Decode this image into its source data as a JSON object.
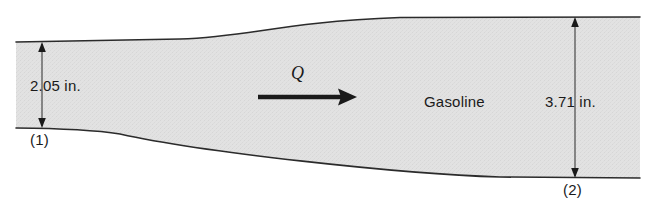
{
  "figure": {
    "type": "engineering-flow-diagram",
    "fill_color": "#e0e0e0",
    "line_color": "#1a1a1a",
    "background_color": "#ffffff"
  },
  "dimensions": {
    "inlet": {
      "value": "2.05 in.",
      "station_label": "(1)"
    },
    "outlet": {
      "value": "3.71 in.",
      "station_label": "(2)"
    }
  },
  "flow": {
    "symbol": "Q",
    "arrow_direction": "right"
  },
  "fluid": {
    "name": "Gasoline"
  },
  "geometry": {
    "inlet_top_y": 42,
    "inlet_bottom_y": 128,
    "outlet_top_y": 17,
    "outlet_bottom_y": 178,
    "left_edge_x": 16,
    "right_edge_x": 640,
    "inlet_dim_line_x": 42,
    "outlet_dim_line_x": 575,
    "flow_arrow_y": 97,
    "flow_arrow_x_start": 258,
    "flow_arrow_x_end": 355
  }
}
